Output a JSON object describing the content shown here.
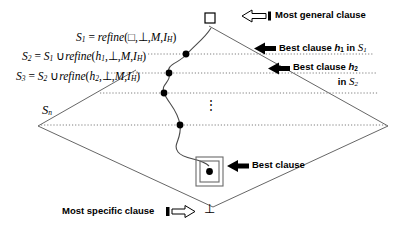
{
  "figure": {
    "colors": {
      "line": "#555555",
      "dotted": "#777777",
      "ink": "#000000",
      "fill_dot": "#000000"
    }
  },
  "lattice": {
    "top_symbol": "□",
    "bottom_symbol": "⊥",
    "vertical_dots": "⋮"
  },
  "equations": [
    {
      "id": "S1",
      "lhs": "S",
      "lhs_sub": "1",
      "text": "S₁ = refine(□, ⊥, M, Iₕ)",
      "parts": {
        "eq": "=",
        "fn": "refine",
        "open": "(",
        "a1": "□",
        "a2": "⊥",
        "a3": "M",
        "a4": "I",
        "a4_sub": "H",
        "close": ")"
      }
    },
    {
      "id": "S2",
      "lhs": "S",
      "lhs_sub": "2",
      "text": "S₂ = S₁ ∪ refine(h₁, ⊥, M, Iₕ)",
      "parts": {
        "eq": "=",
        "prev": "S",
        "prev_sub": "1",
        "union": "∪",
        "fn": "refine",
        "open": "(",
        "a1": "h",
        "a1_sub": "1",
        "a2": "⊥",
        "a3": "M",
        "a4": "I",
        "a4_sub": "H",
        "close": ")"
      }
    },
    {
      "id": "S3",
      "lhs": "S",
      "lhs_sub": "3",
      "text": "S₃ = S₂ ∪ refine(h₂, ⊥, M, Iₕ)",
      "parts": {
        "eq": "=",
        "prev": "S",
        "prev_sub": "2",
        "union": "∪",
        "fn": "refine",
        "open": "(",
        "a1": "h",
        "a1_sub": "2",
        "a2": "⊥",
        "a3": "M",
        "a4": "I",
        "a4_sub": "H",
        "close": ")"
      }
    },
    {
      "id": "Sn",
      "lhs": "S",
      "lhs_sub": "n",
      "text": "Sₙ"
    }
  ],
  "annotations": {
    "most_general": {
      "label": "Most general clause",
      "arrow": "hollow-left-arrow"
    },
    "best_h1": {
      "prefix": "Best clause",
      "var": "h",
      "var_sub": "1",
      "mid": "in",
      "set": "S",
      "set_sub": "1",
      "arrow": "solid-left-arrow"
    },
    "best_h2": {
      "prefix": "Best clause",
      "var": "h",
      "var_sub": "2",
      "line2_mid": "in",
      "set": "S",
      "set_sub": "2",
      "arrow": "solid-left-arrow"
    },
    "best_clause": {
      "label": "Best clause",
      "arrow": "solid-left-arrow"
    },
    "most_specific": {
      "label": "Most specific clause",
      "arrow": "hollow-right-arrow"
    }
  },
  "search_path": {
    "node_count": 5,
    "nodes": [
      {
        "x": 186,
        "y": 54
      },
      {
        "x": 169,
        "y": 73
      },
      {
        "x": 164,
        "y": 93
      },
      {
        "x": 180,
        "y": 125
      },
      {
        "x": 209,
        "y": 171
      }
    ]
  },
  "levels": [
    {
      "id": "S1",
      "y": 54
    },
    {
      "id": "S2",
      "y": 73
    },
    {
      "id": "S3",
      "y": 93
    },
    {
      "id": "Sn",
      "y": 125
    }
  ]
}
